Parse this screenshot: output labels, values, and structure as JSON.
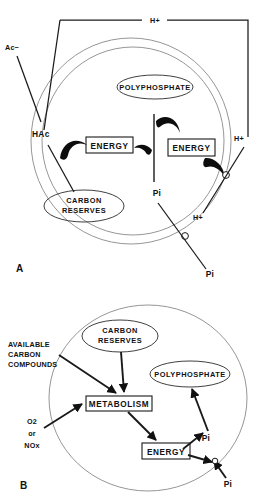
{
  "figure": {
    "panels": [
      {
        "id": "A",
        "label": "A",
        "cell_shape": "double-circle",
        "external_labels": [
          {
            "name": "h-plus-top",
            "text": "H+"
          },
          {
            "name": "acetate-anion",
            "text": "Ac−"
          },
          {
            "name": "h-plus-right-upper",
            "text": "H+"
          },
          {
            "name": "h-plus-right-lower",
            "text": "H+"
          },
          {
            "name": "phosphate-external",
            "text": "Pi"
          }
        ],
        "internal_labels": [
          {
            "name": "undissociated-acetic-acid",
            "text": "HAc"
          },
          {
            "name": "phosphate-internal",
            "text": "Pi"
          }
        ],
        "ellipses": [
          {
            "name": "polyphosphate",
            "text": "POLYPHOSPHATE"
          },
          {
            "name": "carbon-reserves",
            "line1": "CARBON",
            "line2": "RESERVES"
          }
        ],
        "boxes": [
          {
            "name": "energy-left",
            "text": "ENERGY"
          },
          {
            "name": "energy-right",
            "text": "ENERGY"
          }
        ]
      },
      {
        "id": "B",
        "label": "B",
        "cell_shape": "single-circle",
        "external_labels": [
          {
            "name": "available-carbon-compounds",
            "line1": "AVAILABLE",
            "line2": "CARBON",
            "line3": "COMPOUNDS"
          },
          {
            "name": "electron-acceptors-o2",
            "text": "O2"
          },
          {
            "name": "electron-acceptors-or",
            "text": "or"
          },
          {
            "name": "electron-acceptors-nox",
            "text": "NOx"
          },
          {
            "name": "phosphate-external",
            "text": "Pi"
          }
        ],
        "internal_labels": [
          {
            "name": "phosphate-internal",
            "text": "Pi"
          }
        ],
        "ellipses": [
          {
            "name": "carbon-reserves",
            "line1": "CARBON",
            "line2": "RESERVES"
          },
          {
            "name": "polyphosphate",
            "text": "POLYPHOSPHATE"
          }
        ],
        "boxes": [
          {
            "name": "metabolism",
            "text": "METABOLISM"
          },
          {
            "name": "energy",
            "text": "ENERGY"
          }
        ]
      }
    ],
    "colors": {
      "ink": "#111111",
      "membrane": "#8a8a8a",
      "background": "#ffffff"
    }
  }
}
